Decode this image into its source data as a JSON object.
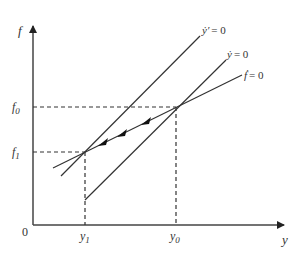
{
  "diagram": {
    "type": "phase-diagram",
    "axes": {
      "x_label": "y",
      "y_label": "f",
      "origin_label": "0",
      "color": "#444444"
    },
    "ticks": {
      "x": [
        {
          "label": "y",
          "sub": "1",
          "name": "y1"
        },
        {
          "label": "y",
          "sub": "0",
          "name": "y0"
        }
      ],
      "y": [
        {
          "label": "f",
          "sub": "0",
          "name": "f0"
        },
        {
          "label": "f",
          "sub": "1",
          "name": "f1"
        }
      ]
    },
    "lines": [
      {
        "name": "y-prime-dot-zero",
        "label_lhs": "ẏ′",
        "label_rhs": "= 0"
      },
      {
        "name": "y-dot-zero",
        "label_lhs": "ẏ",
        "label_rhs": "= 0"
      },
      {
        "name": "f-dot-zero",
        "label_lhs": "ḟ",
        "label_rhs": "= 0"
      }
    ],
    "equilibria": [
      {
        "name": "initial",
        "x": "y0",
        "y": "f0"
      },
      {
        "name": "new",
        "x": "y1",
        "y": "f1"
      }
    ],
    "transition_arrows": 3,
    "line_color": "#333333"
  }
}
